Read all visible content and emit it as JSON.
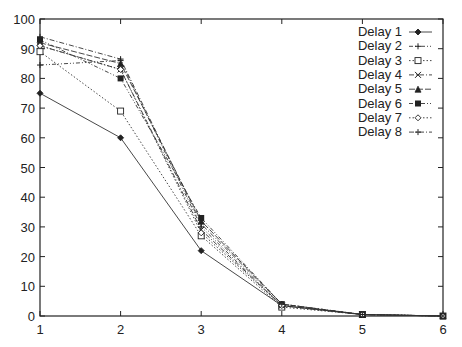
{
  "chart_data": {
    "type": "line",
    "title": "",
    "xlabel": "",
    "ylabel": "",
    "x": [
      1,
      2,
      3,
      4,
      5,
      6
    ],
    "xlim": [
      1,
      6
    ],
    "ylim": [
      0,
      100
    ],
    "x_ticks": [
      1,
      2,
      3,
      4,
      5,
      6
    ],
    "y_ticks": [
      0,
      10,
      20,
      30,
      40,
      50,
      60,
      70,
      80,
      90,
      100
    ],
    "grid": false,
    "legend_position": "upper right (inside)",
    "series": [
      {
        "name": "Delay 1",
        "values": [
          75,
          60,
          22,
          3.5,
          0.5,
          0
        ],
        "marker": "diamond",
        "dash": "solid"
      },
      {
        "name": "Delay 2",
        "values": [
          84.5,
          86,
          30,
          3.5,
          0.5,
          0
        ],
        "marker": "plus",
        "dash": "dash-dot-dot"
      },
      {
        "name": "Delay 3",
        "values": [
          89,
          69,
          27,
          3,
          0.5,
          0
        ],
        "marker": "square",
        "dash": "dotted"
      },
      {
        "name": "Delay 4",
        "values": [
          91,
          83,
          29,
          3.5,
          0.5,
          0
        ],
        "marker": "cross",
        "dash": "dash-dot"
      },
      {
        "name": "Delay 5",
        "values": [
          92,
          85,
          32,
          4,
          0.5,
          0
        ],
        "marker": "triangle",
        "dash": "long-dash"
      },
      {
        "name": "Delay 6",
        "values": [
          93,
          80,
          33,
          4,
          0.5,
          0
        ],
        "marker": "filled-square",
        "dash": "dash-dot-dot"
      },
      {
        "name": "Delay 7",
        "values": [
          91,
          83,
          28,
          3.5,
          0.5,
          0
        ],
        "marker": "small-diamond",
        "dash": "dotted"
      },
      {
        "name": "Delay 8",
        "values": [
          94,
          86.5,
          31,
          4,
          0.5,
          0
        ],
        "marker": "plus",
        "dash": "dash-dot"
      }
    ]
  }
}
